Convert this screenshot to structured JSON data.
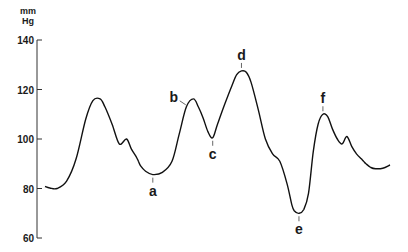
{
  "chart_data": {
    "type": "line",
    "title": "",
    "xlabel": "",
    "ylabel": "mm Hg",
    "ylabel_lines": [
      "mm",
      "Hg"
    ],
    "ylim": [
      60,
      140
    ],
    "yticks": [
      60,
      80,
      100,
      120,
      140
    ],
    "ytick_labels": [
      "60",
      "80",
      "100",
      "120",
      "140"
    ],
    "grid": false,
    "series": [
      {
        "name": "arterial pressure",
        "x": [
          0,
          2,
          5,
          9,
          13,
          17,
          20,
          23,
          25,
          28,
          31,
          34,
          36,
          38,
          39,
          40,
          42,
          45,
          49,
          53,
          56,
          59,
          62,
          64,
          66,
          68,
          70,
          72,
          75,
          78,
          80,
          82,
          84,
          86,
          89,
          92,
          95,
          98,
          101,
          103,
          104,
          106,
          108,
          110,
          112,
          114,
          116,
          118,
          120,
          122,
          124,
          126,
          128,
          130,
          132,
          133,
          134,
          136,
          138,
          141,
          144
        ],
        "values": [
          80.8,
          80.2,
          80.0,
          83.0,
          92.0,
          108.0,
          115.5,
          116.2,
          113.0,
          106.0,
          98.0,
          100.0,
          96.0,
          93.0,
          91.0,
          89.0,
          87.0,
          85.6,
          86.5,
          91.0,
          102.0,
          113.0,
          116.2,
          113.0,
          108.5,
          103.0,
          100.5,
          106.0,
          114.0,
          121.5,
          126.0,
          127.5,
          127.0,
          123.0,
          112.0,
          100.0,
          94.0,
          91.0,
          82.0,
          73.5,
          71.0,
          70.0,
          71.5,
          78.0,
          95.0,
          106.0,
          110.0,
          109.0,
          104.0,
          100.0,
          98.0,
          101.0,
          97.0,
          94.0,
          92.0,
          91.0,
          90.0,
          88.5,
          88.0,
          88.2,
          89.5
        ]
      }
    ],
    "annotations": [
      {
        "label": "a",
        "x": 45,
        "value": 85.6,
        "position": "below"
      },
      {
        "label": "b",
        "x": 60,
        "value": 113.0,
        "position": "upper-left"
      },
      {
        "label": "c",
        "x": 70,
        "value": 100.5,
        "position": "below"
      },
      {
        "label": "d",
        "x": 82,
        "value": 127.5,
        "position": "above"
      },
      {
        "label": "e",
        "x": 106,
        "value": 70.0,
        "position": "below"
      },
      {
        "label": "f",
        "x": 116,
        "value": 110.0,
        "position": "above"
      }
    ]
  }
}
